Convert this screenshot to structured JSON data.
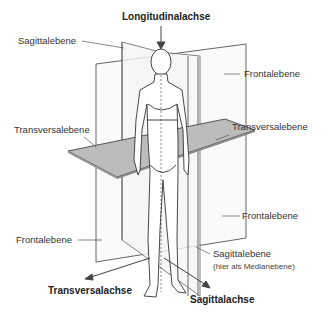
{
  "diagram": {
    "labels": {
      "longitudinal_axis": "Longitudinalachse",
      "sagittal_plane_top": "Sagittalebene",
      "frontal_plane_top_right": "Frontalebene",
      "transversal_plane_left": "Transversalebene",
      "transversal_plane_right": "Transversalebene",
      "frontal_plane_bottom_right": "Frontalebene",
      "frontal_plane_bottom_left": "Frontalebene",
      "sagittal_plane_bottom": "Sagittalebene",
      "sagittal_plane_note": "(hier als Medianebene)",
      "transversal_axis": "Transversalachse",
      "sagittal_axis": "Sagittalachse"
    },
    "colors": {
      "line": "#555555",
      "plane_fill": "#b8b8b8",
      "figure_stroke": "#333333",
      "text": "#333333"
    }
  }
}
